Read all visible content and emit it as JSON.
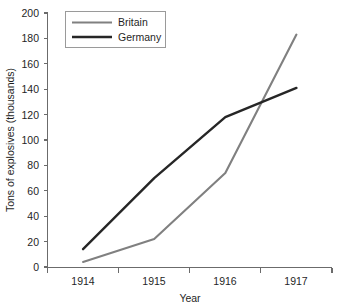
{
  "chart_data": {
    "type": "line",
    "title": "",
    "xlabel": "Year",
    "ylabel": "Tons of explosives (thousands)",
    "categories": [
      "1914",
      "1915",
      "1916",
      "1917"
    ],
    "x": [
      1914,
      1915,
      1916,
      1917
    ],
    "ylim": [
      0,
      200
    ],
    "yticks": [
      0,
      20,
      40,
      60,
      80,
      100,
      120,
      140,
      160,
      180,
      200
    ],
    "ytick_labels": [
      "0",
      "20",
      "40",
      "60",
      "80",
      "100",
      "120",
      "140",
      "160",
      "180",
      "200"
    ],
    "grid": false,
    "legend_position": "top-left",
    "series": [
      {
        "name": "Britain",
        "color": "#808080",
        "values": [
          4,
          22,
          74,
          183
        ]
      },
      {
        "name": "Germany",
        "color": "#262626",
        "values": [
          14,
          70,
          118,
          141
        ]
      }
    ]
  },
  "axes": {
    "y_title": "Tons of explosives (thousands)",
    "x_title": "Year",
    "y_labels": [
      "200",
      "180",
      "160",
      "140",
      "120",
      "100",
      "80",
      "60",
      "40",
      "20",
      "0"
    ],
    "x_labels": [
      "1914",
      "1915",
      "1916",
      "1917"
    ]
  },
  "legend": {
    "entries": [
      {
        "label": "Britain",
        "color": "#808080"
      },
      {
        "label": "Germany",
        "color": "#262626"
      }
    ]
  }
}
